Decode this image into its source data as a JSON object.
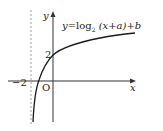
{
  "diagram": {
    "type": "function-graph",
    "equation": {
      "y": "y",
      "eq": "=",
      "log": "log",
      "base": "2",
      "arg": "(x+a)",
      "rest": "+b"
    },
    "axes": {
      "x_label": "x",
      "y_label": "y",
      "origin_label": "O"
    },
    "marks": {
      "y_intercept": "2",
      "asymptote_x": "−2"
    },
    "colors": {
      "curve": "#1a1a1a",
      "axis": "#333333",
      "asymptote": "#888888"
    }
  }
}
